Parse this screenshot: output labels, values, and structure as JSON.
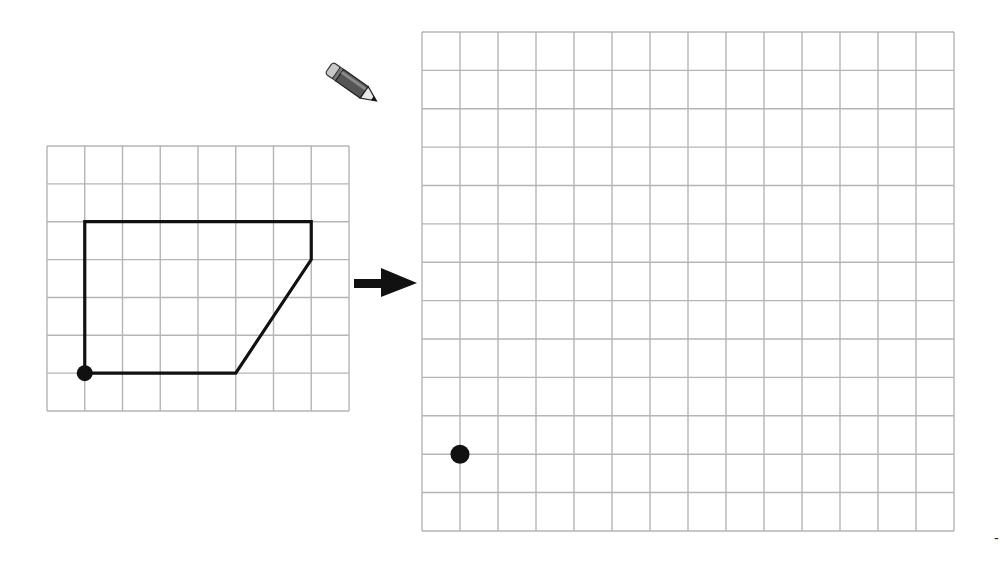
{
  "diagram": {
    "type": "grid-enlargement",
    "colors": {
      "background": "#ffffff",
      "grid_line": "#b5b5b5",
      "shape_line": "#111111",
      "dot": "#111111",
      "arrow": "#111111"
    },
    "small_grid": {
      "x": 47,
      "y": 146,
      "cols": 8,
      "rows": 7,
      "cell_w": 37.75,
      "cell_h": 37.86
    },
    "shape": {
      "grid_vertices": [
        [
          1,
          6
        ],
        [
          1,
          2
        ],
        [
          7,
          2
        ],
        [
          7,
          3
        ],
        [
          5,
          6
        ]
      ],
      "start_dot": [
        1,
        6
      ]
    },
    "large_grid": {
      "x": 422,
      "y": 32,
      "cols": 14,
      "rows": 13,
      "cell_w": 38,
      "cell_h": 38.38
    },
    "large_start_dot": [
      1,
      11
    ],
    "arrow": {
      "direction": "right",
      "from_x": 354,
      "to_x": 417,
      "y": 283
    },
    "pencil_icon": {
      "x": 333,
      "y": 60
    },
    "corner_mark": "-"
  }
}
